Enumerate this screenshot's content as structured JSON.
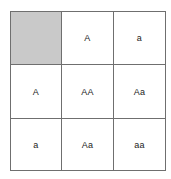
{
  "diagram": {
    "type": "punnett-square",
    "corner_label": "",
    "column_alleles": [
      "A",
      "a"
    ],
    "row_alleles": [
      "A",
      "a"
    ],
    "grid": [
      [
        "",
        "A",
        "a"
      ],
      [
        "A",
        "AA",
        "Aa"
      ],
      [
        "a",
        "Aa",
        "aa"
      ]
    ],
    "colors": {
      "corner_fill": "#c9c9c9",
      "cell_fill": "#ffffff",
      "border": "#6f6f6f",
      "text": "#1a1a1a",
      "background": "#ffffff"
    }
  }
}
